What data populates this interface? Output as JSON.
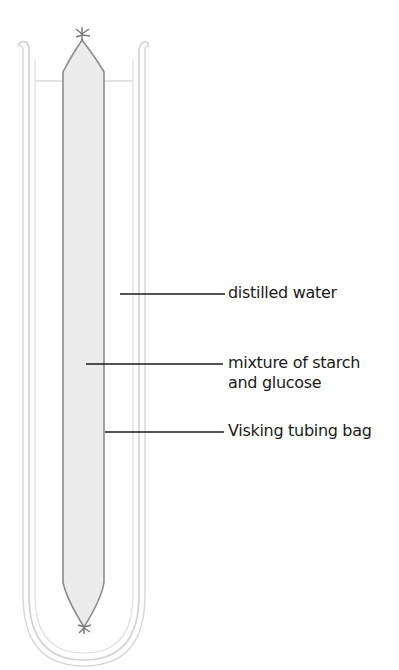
{
  "diagram": {
    "title": "",
    "labels": [
      {
        "id": "distilled-water",
        "lines": [
          "distilled water"
        ]
      },
      {
        "id": "starch-glucose",
        "lines": [
          "mixture of starch",
          "and glucose"
        ]
      },
      {
        "id": "visking-bag",
        "lines": [
          "Visking tubing bag"
        ]
      }
    ]
  },
  "colors": {
    "tube_outline": "#d0d0d0",
    "bag_outline": "#8a8a8a",
    "bag_fill": "#ebebeb",
    "leader_line": "#1a1a1a",
    "label_text": "#1a1a1a",
    "water_line": "#c8c8c8"
  }
}
